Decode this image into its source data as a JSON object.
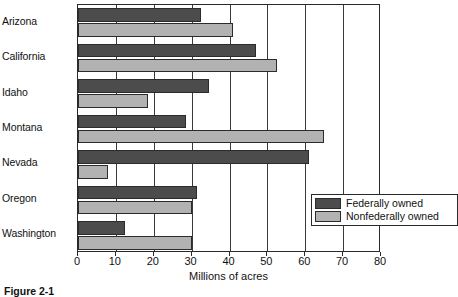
{
  "figure": {
    "caption": "Figure 2-1"
  },
  "legend": {
    "position": "inside-bottom-right",
    "entries": [
      {
        "label": "Federally owned",
        "color": "#4c4c4c",
        "name": "federal"
      },
      {
        "label": "Nonfederally owned",
        "color": "#b2b2b2",
        "name": "nonfederal"
      }
    ]
  },
  "axis": {
    "x_title": "Millions of acres",
    "x_ticks": [
      "0",
      "10",
      "20",
      "30",
      "40",
      "50",
      "60",
      "70",
      "80"
    ]
  },
  "chart_data": {
    "type": "bar",
    "orientation": "horizontal",
    "title": "",
    "xlabel": "Millions of acres",
    "ylabel": "",
    "xlim": [
      0,
      80
    ],
    "ylim": null,
    "grid": true,
    "grid_axis": "x",
    "legend_position": "inside-bottom-right",
    "categories": [
      "Arizona",
      "California",
      "Idaho",
      "Montana",
      "Nevada",
      "Oregon",
      "Washington"
    ],
    "series": [
      {
        "name": "Federally owned",
        "color": "#4c4c4c",
        "values": [
          32.5,
          47.0,
          34.5,
          28.5,
          61.0,
          31.5,
          12.5
        ]
      },
      {
        "name": "Nonfederally owned",
        "color": "#b2b2b2",
        "values": [
          41.0,
          52.5,
          18.5,
          65.0,
          8.0,
          30.0,
          30.0
        ]
      }
    ]
  }
}
